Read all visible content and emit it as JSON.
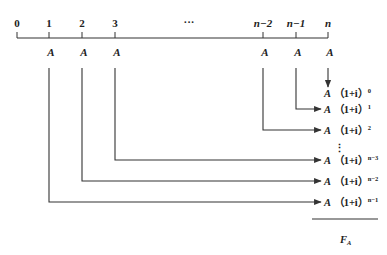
{
  "timeline": {
    "ticks": [
      {
        "label": "0",
        "x": 17,
        "payment": ""
      },
      {
        "label": "1",
        "x": 49,
        "payment": "A"
      },
      {
        "label": "2",
        "x": 82,
        "payment": "A"
      },
      {
        "label": "3",
        "x": 115,
        "payment": "A"
      },
      {
        "label": "n−2",
        "x": 263,
        "payment": "A"
      },
      {
        "label": "n−1",
        "x": 296,
        "payment": "A"
      },
      {
        "label": "n",
        "x": 328,
        "payment": "A"
      }
    ],
    "ellipsis": "···"
  },
  "results": [
    {
      "base": "A",
      "factor": "（1+i）",
      "exponent": "0",
      "y": 93
    },
    {
      "base": "A",
      "factor": "（1+i）",
      "exponent": "1",
      "y": 113
    },
    {
      "base": "A",
      "factor": "（1+i）",
      "exponent": "2",
      "y": 134
    },
    {
      "base": "A",
      "factor": "（1+i）",
      "exponent": "n−3",
      "y": 164
    },
    {
      "base": "A",
      "factor": "（1+i）",
      "exponent": "n−2",
      "y": 185
    },
    {
      "base": "A",
      "factor": "（1+i）",
      "exponent": "n−1",
      "y": 206
    }
  ],
  "vertical_ellipsis": "⋮",
  "total": {
    "symbol": "F",
    "subscript": "A"
  },
  "colors": {
    "line": "#333333",
    "text": "#222222",
    "background": "#ffffff"
  }
}
